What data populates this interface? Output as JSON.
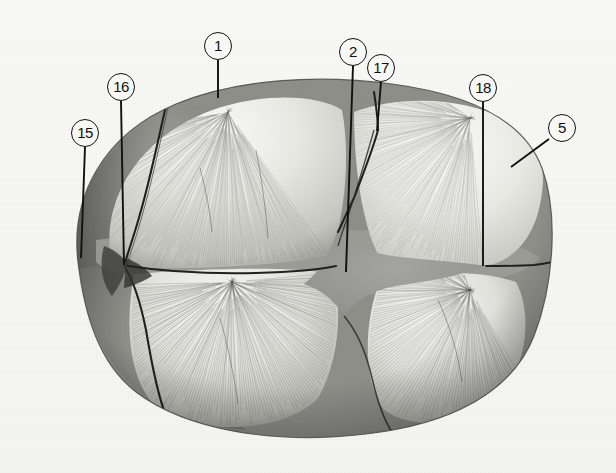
{
  "figure": {
    "background_color": "#f7f7f5",
    "ink_color": "#111111",
    "fontanelle_color": "#9a9a9a",
    "bone_light": "#efefec",
    "bone_mid": "#c9c9c4",
    "bone_dark": "#6f6f6b"
  },
  "labels": [
    {
      "id": "1",
      "text": "1",
      "cx": 218,
      "cy": 46,
      "leader": {
        "x1": 218,
        "y1": 60,
        "x2": 218,
        "y2": 98
      }
    },
    {
      "id": "2",
      "text": "2",
      "cx": 353,
      "cy": 52,
      "leader": {
        "x1": 353,
        "y1": 66,
        "x2": 346,
        "y2": 272
      }
    },
    {
      "id": "17",
      "text": "17",
      "cx": 381,
      "cy": 68,
      "leader": {
        "x1": 381,
        "y1": 82,
        "x2": 377,
        "y2": 131
      }
    },
    {
      "id": "18",
      "text": "18",
      "cx": 483,
      "cy": 88,
      "leader": {
        "x1": 483,
        "y1": 102,
        "x2": 483,
        "y2": 266
      }
    },
    {
      "id": "5",
      "text": "5",
      "cx": 562,
      "cy": 128,
      "leader": {
        "x1": 549,
        "y1": 139,
        "x2": 511,
        "y2": 167
      }
    },
    {
      "id": "16",
      "text": "16",
      "cx": 121,
      "cy": 87,
      "leader": {
        "x1": 121,
        "y1": 101,
        "x2": 124,
        "y2": 265
      }
    },
    {
      "id": "15",
      "text": "15",
      "cx": 85,
      "cy": 133,
      "leader": {
        "x1": 85,
        "y1": 147,
        "x2": 81,
        "y2": 258
      }
    }
  ],
  "regions": [
    {
      "name": "frontal-bone-left-anterior",
      "label_ref": "15"
    },
    {
      "name": "coronal-suture",
      "label_ref": "16"
    },
    {
      "name": "parietal-bone-upper-left",
      "label_ref": "1"
    },
    {
      "name": "anterior-fontanelle",
      "label_ref": "2"
    },
    {
      "name": "sagittal-suture",
      "label_ref": "17"
    },
    {
      "name": "lambdoid-suture",
      "label_ref": "18"
    },
    {
      "name": "occipital-bone-right",
      "label_ref": "5"
    }
  ]
}
